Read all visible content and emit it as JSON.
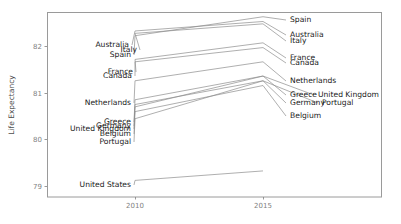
{
  "chart_data": {
    "type": "line",
    "subtype": "slope-chart",
    "title": "",
    "xlabel": "",
    "ylabel": "Life Expectancy",
    "x": [
      2010,
      2015
    ],
    "xlim": [
      2008.6,
      2016.9
    ],
    "ylim": [
      78.55,
      82.45
    ],
    "xticks": [
      2010,
      2015
    ],
    "xticklabels": [
      "2010",
      "2015"
    ],
    "yticks": [
      79,
      80,
      81,
      82
    ],
    "yticklabels": [
      "79",
      "80",
      "81",
      "82"
    ],
    "grid": false,
    "legend": "none",
    "label_position": "both ends",
    "series": [
      {
        "name": "Spain",
        "values": [
          81.95,
          82.35
        ],
        "left_label": "Spain",
        "right_label": "Spain"
      },
      {
        "name": "Italy",
        "values": [
          82.0,
          82.2
        ],
        "left_label": "Italy",
        "right_label": "Italy"
      },
      {
        "name": "Australia",
        "values": [
          82.05,
          82.25
        ],
        "left_label": "Australia",
        "right_label": "Australia"
      },
      {
        "name": "France",
        "values": [
          81.45,
          81.8
        ],
        "left_label": "France",
        "right_label": "France"
      },
      {
        "name": "Canada",
        "values": [
          81.4,
          81.7
        ],
        "left_label": "Canada",
        "right_label": "Canada"
      },
      {
        "name": "Netherlands",
        "values": [
          81.0,
          81.4
        ],
        "left_label": "Netherlands",
        "right_label": "Netherlands"
      },
      {
        "name": "Greece",
        "values": [
          80.6,
          81.1
        ],
        "left_label": "Greece",
        "right_label": "Greece"
      },
      {
        "name": "Germany",
        "values": [
          80.5,
          81.0
        ],
        "left_label": "Germany",
        "right_label": "Germany"
      },
      {
        "name": "United Kingdom",
        "values": [
          80.45,
          81.1
        ],
        "left_label": "United Kingdom",
        "right_label": "United Kingdom"
      },
      {
        "name": "Belgium",
        "values": [
          80.35,
          80.9
        ],
        "left_label": "Belgium",
        "right_label": "Belgium"
      },
      {
        "name": "Portugal",
        "values": [
          80.2,
          81.0
        ],
        "left_label": "Portugal",
        "right_label": "Portugal"
      },
      {
        "name": "United States",
        "values": [
          78.9,
          79.1
        ],
        "left_label": "United States",
        "right_label": "United States"
      }
    ],
    "colors": {
      "line": "#8c8c8c",
      "label": "#1a1a1a",
      "axis_text": "#7f7f7f",
      "axis_title": "#4d4d4d",
      "panel_border": "#9a9a9a",
      "background": "#ffffff"
    }
  },
  "left_labels": [
    {
      "text": "Australia",
      "x": 129,
      "y": 47
    },
    {
      "text": "Italy",
      "x": 137,
      "y": 52
    },
    {
      "text": "Spain",
      "x": 131,
      "y": 57
    },
    {
      "text": "France",
      "x": 133,
      "y": 74
    },
    {
      "text": "Canada",
      "x": 132,
      "y": 78
    },
    {
      "text": "Netherlands",
      "x": 131,
      "y": 105
    },
    {
      "text": "Greece",
      "x": 131,
      "y": 124
    },
    {
      "text": "Germany",
      "x": 131,
      "y": 128
    },
    {
      "text": "United Kingdom",
      "x": 131,
      "y": 131
    },
    {
      "text": "Belgium",
      "x": 131,
      "y": 136
    },
    {
      "text": "Portugal",
      "x": 131,
      "y": 144
    },
    {
      "text": "United States",
      "x": 131,
      "y": 187
    }
  ],
  "right_labels": [
    {
      "text": "Spain",
      "x": 290,
      "y": 22
    },
    {
      "text": "Australia",
      "x": 290,
      "y": 37
    },
    {
      "text": "Italy",
      "x": 290,
      "y": 43
    },
    {
      "text": "France",
      "x": 290,
      "y": 60
    },
    {
      "text": "Canada",
      "x": 290,
      "y": 65
    },
    {
      "text": "Netherlands",
      "x": 290,
      "y": 83
    },
    {
      "text": "Greece",
      "x": 290,
      "y": 97
    },
    {
      "text": "United Kingdom",
      "x": 318,
      "y": 97
    },
    {
      "text": "Germany",
      "x": 290,
      "y": 105
    },
    {
      "text": "Portugal",
      "x": 322,
      "y": 105
    },
    {
      "text": "Belgium",
      "x": 290,
      "y": 118
    }
  ],
  "axis": {
    "y_title": "Life Expectancy",
    "y_ticks": [
      {
        "label": "82",
        "y": 46
      },
      {
        "label": "81",
        "y": 93
      },
      {
        "label": "80",
        "y": 139
      },
      {
        "label": "79",
        "y": 186
      }
    ],
    "x_ticks": [
      {
        "label": "2010",
        "x": 135
      },
      {
        "label": "2015",
        "x": 263
      }
    ]
  },
  "geometry": {
    "panel": {
      "left": 47,
      "top": 12,
      "right": 382,
      "bottom": 197
    },
    "left_x": 135,
    "right_x": 263
  }
}
